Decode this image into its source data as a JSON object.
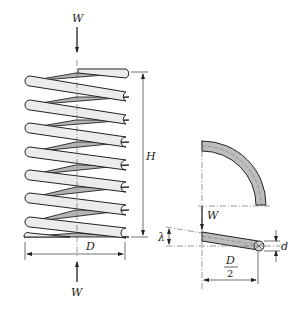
{
  "figure": {
    "left_view": {
      "name": "spring-side-view",
      "coil_count": 8,
      "labels": {
        "load_top": "W",
        "load_bottom": "W",
        "height": "H",
        "diameter": "D"
      }
    },
    "right_view": {
      "name": "coil-detail-view",
      "labels": {
        "load": "W",
        "deflection": "λ",
        "wire_diameter": "d",
        "half_diameter_num": "D",
        "half_diameter_den": "2"
      }
    },
    "colors": {
      "outline": "#222222",
      "front_coil_fill": "#ececec",
      "back_coil_fill": "#b4b4b4",
      "wire_fill": "#bdbdbd",
      "background": "#ffffff"
    }
  }
}
